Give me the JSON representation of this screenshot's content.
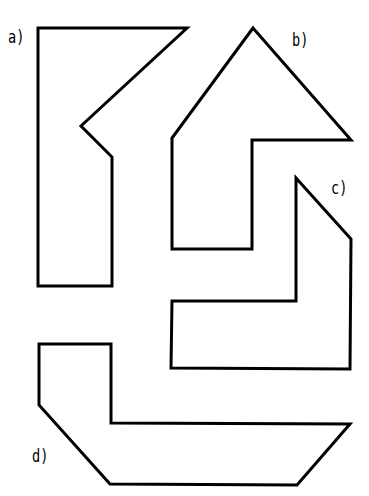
{
  "figure": {
    "width": 369,
    "height": 496,
    "background": "#ffffff",
    "stroke_color": "#000000",
    "shapes": [
      {
        "id": "a",
        "label": "a)",
        "label_pos": [
          8,
          29
        ],
        "points": "38,28 187,28 81,126 112,157 112,286 38,286"
      },
      {
        "id": "b",
        "label": "b)",
        "label_pos": [
          292,
          32
        ],
        "points": "253,28 351,140 252,140 252,249 172,249 172,138"
      },
      {
        "id": "c",
        "label": "c)",
        "label_pos": [
          331,
          180
        ],
        "points": "296,178 351,239 350,369 171,368 172,301 296,301"
      },
      {
        "id": "d",
        "label": "d)",
        "label_pos": [
          32,
          448
        ],
        "points": "39,344 111,344 111,423 350,424 297,485 110,484 39,405"
      }
    ]
  }
}
